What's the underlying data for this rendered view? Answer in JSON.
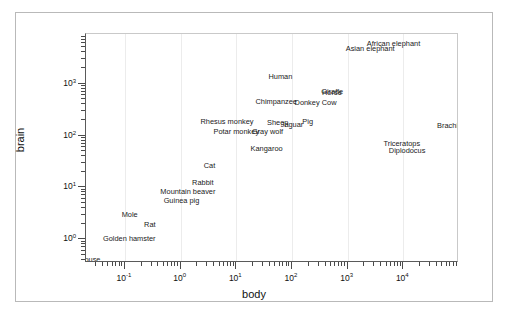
{
  "chart_data": {
    "type": "scatter",
    "title": "",
    "xlabel": "body",
    "ylabel": "brain",
    "xscale": "log",
    "yscale": "log",
    "xlim": [
      0.02,
      100000
    ],
    "ylim": [
      0.35,
      9000
    ],
    "grid": true,
    "legend": null,
    "marker_style": "text-labels",
    "x_tick_labels": [
      "10-1",
      "10 0",
      "10 1",
      "10 2",
      "10 3",
      "10 4"
    ],
    "x_tick_values": [
      0.1,
      1,
      10,
      100,
      1000,
      10000
    ],
    "y_tick_labels": [
      "10 0",
      "10 1",
      "10 2",
      "10 3"
    ],
    "y_tick_values": [
      1,
      10,
      100,
      1000
    ],
    "points": [
      {
        "label": "Mouse",
        "body": 0.023,
        "brain": 0.4
      },
      {
        "label": "Golden hamster",
        "body": 0.12,
        "brain": 1.0
      },
      {
        "label": "Rat",
        "body": 0.28,
        "brain": 1.9
      },
      {
        "label": "Mole",
        "body": 0.122,
        "brain": 3.0
      },
      {
        "label": "Guinea pig",
        "body": 1.04,
        "brain": 5.5
      },
      {
        "label": "Mountain beaver",
        "body": 1.35,
        "brain": 8.1
      },
      {
        "label": "Rabbit",
        "body": 2.5,
        "brain": 12.1
      },
      {
        "label": "Cat",
        "body": 3.3,
        "brain": 25.6
      },
      {
        "label": "Kangaroo",
        "body": 35.0,
        "brain": 56.0
      },
      {
        "label": "Potar monkey",
        "body": 10.0,
        "brain": 115.0
      },
      {
        "label": "Gray wolf",
        "body": 36.33,
        "brain": 119.5
      },
      {
        "label": "Rhesus monkey",
        "body": 6.8,
        "brain": 179.0
      },
      {
        "label": "Sheep",
        "body": 55.5,
        "brain": 175.0
      },
      {
        "label": "Jaguar",
        "body": 100.0,
        "brain": 157.0
      },
      {
        "label": "Pig",
        "body": 192.0,
        "brain": 180.0
      },
      {
        "label": "Chimpanzee",
        "body": 52.16,
        "brain": 440.0
      },
      {
        "label": "Donkey",
        "body": 187.1,
        "brain": 419.0
      },
      {
        "label": "Horse",
        "body": 521.0,
        "brain": 655.0
      },
      {
        "label": "Giraffe",
        "body": 529.0,
        "brain": 680.0
      },
      {
        "label": "Cow",
        "body": 465.0,
        "brain": 423.0
      },
      {
        "label": "Human",
        "body": 62.0,
        "brain": 1320.0
      },
      {
        "label": "Asian elephant",
        "body": 2547.0,
        "brain": 4603.0
      },
      {
        "label": "African elephant",
        "body": 6654.0,
        "brain": 5712.0
      },
      {
        "label": "Triceratops",
        "body": 9400.0,
        "brain": 70.0
      },
      {
        "label": "Diplodocus",
        "body": 11700.0,
        "brain": 50.0
      },
      {
        "label": "Brachiosau",
        "body": 87000.0,
        "brain": 154.5
      }
    ]
  }
}
